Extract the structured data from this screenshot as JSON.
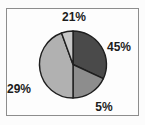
{
  "chart_data": {
    "type": "pie",
    "title": "",
    "legend": "none",
    "background_color": "#fcfcfc",
    "frame_border_color": "#8d8d8d",
    "outline_color": "#1f1f1f",
    "label_color": "#1c1c1c",
    "geometry": {
      "cx": 73,
      "cy": 64.5,
      "r": 33.5
    },
    "categories": [
      "45%",
      "5%",
      "29%",
      "21%"
    ],
    "values": [
      45,
      5,
      29,
      21
    ],
    "slices": [
      {
        "label": "45%",
        "value": 45,
        "color": "#4a4a4a",
        "start_deg": 0,
        "end_deg": 115,
        "label_pos": {
          "x": 119,
          "y": 47
        }
      },
      {
        "label": "5%",
        "value": 5,
        "color": "#8d8d8d",
        "start_deg": 115,
        "end_deg": 180,
        "label_pos": {
          "x": 104,
          "y": 107
        }
      },
      {
        "label": "29%",
        "value": 29,
        "color": "#b1b1b1",
        "start_deg": 180,
        "end_deg": 340,
        "label_pos": {
          "x": 19,
          "y": 89
        }
      },
      {
        "label": "21%",
        "value": 21,
        "color": "#c7c7c7",
        "start_deg": 340,
        "end_deg": 360,
        "label_pos": {
          "x": 74,
          "y": 17
        }
      }
    ]
  }
}
